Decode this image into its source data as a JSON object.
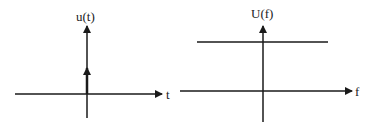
{
  "left_plot": {
    "title": "u(t)",
    "x_axis_label": "t",
    "signal": "impulse at t=0"
  },
  "right_plot": {
    "title": "U(f)",
    "x_axis_label": "f",
    "signal": "constant spectrum"
  },
  "colors": {
    "stroke": "#1a1a1a",
    "background": "#ffffff"
  }
}
